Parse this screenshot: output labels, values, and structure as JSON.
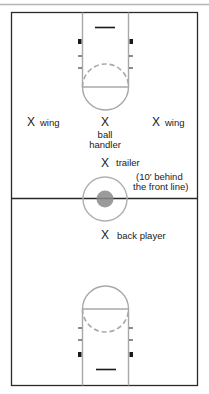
{
  "diagram": {
    "colors": {
      "court_line": "#2a2a2a",
      "lane_line": "#a8a8a8",
      "top_border": "#b5b5b5",
      "center_dot": "#8a8a8a"
    },
    "players": [
      {
        "marker": "X",
        "label": "wing",
        "role": "left-wing"
      },
      {
        "marker": "X",
        "label": "ball\nhandler",
        "label_line1": "ball",
        "label_line2": "handler",
        "role": "ball-handler"
      },
      {
        "marker": "X",
        "label": "wing",
        "role": "right-wing"
      },
      {
        "marker": "X",
        "label": "trailer",
        "role": "trailer",
        "note_line1": "(10′ behind",
        "note_line2": "the front line)"
      },
      {
        "marker": "X",
        "label": "back player",
        "role": "back-player"
      }
    ]
  }
}
